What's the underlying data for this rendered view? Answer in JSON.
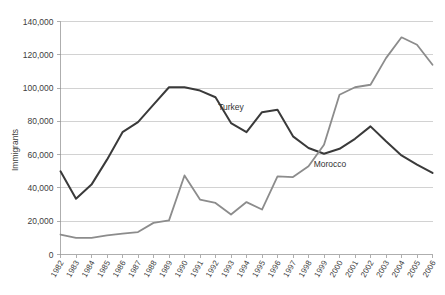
{
  "chart_data": {
    "type": "line",
    "title": "",
    "xlabel": "",
    "ylabel": "Immigrants",
    "ylim": [
      0,
      140000
    ],
    "ytick_labels": [
      "0",
      "20,000",
      "40,000",
      "60,000",
      "80,000",
      "100,000",
      "120,000",
      "140,000"
    ],
    "ytick_values": [
      0,
      20000,
      40000,
      60000,
      80000,
      100000,
      120000,
      140000
    ],
    "grid": true,
    "legend_position": "inline-annotations",
    "categories": [
      "1982",
      "1983",
      "1984",
      "1985",
      "1986",
      "1987",
      "1988",
      "1989",
      "1990",
      "1991",
      "1992",
      "1993",
      "1994",
      "1995",
      "1996",
      "1997",
      "1998",
      "1999",
      "2000",
      "2001",
      "2002",
      "2003",
      "2004",
      "2005",
      "2006"
    ],
    "series": [
      {
        "name": "Turkey",
        "color": "#3a3a3a",
        "label_x_category": "1993",
        "values": [
          50000,
          33500,
          42000,
          57000,
          73500,
          79500,
          90000,
          100500,
          100500,
          98500,
          94500,
          79000,
          73500,
          85500,
          87000,
          71000,
          64000,
          60500,
          63500,
          69500,
          77000,
          68000,
          59500,
          54000,
          49000
        ]
      },
      {
        "name": "Morocco",
        "color": "#8c8c8c",
        "label_x_category": "1999",
        "values": [
          12000,
          10000,
          10000,
          11500,
          12500,
          13500,
          19000,
          20500,
          47500,
          33000,
          31000,
          24000,
          31500,
          27000,
          47000,
          46500,
          53000,
          66000,
          96000,
          100500,
          102000,
          118000,
          130500,
          126000,
          114000
        ]
      }
    ]
  }
}
